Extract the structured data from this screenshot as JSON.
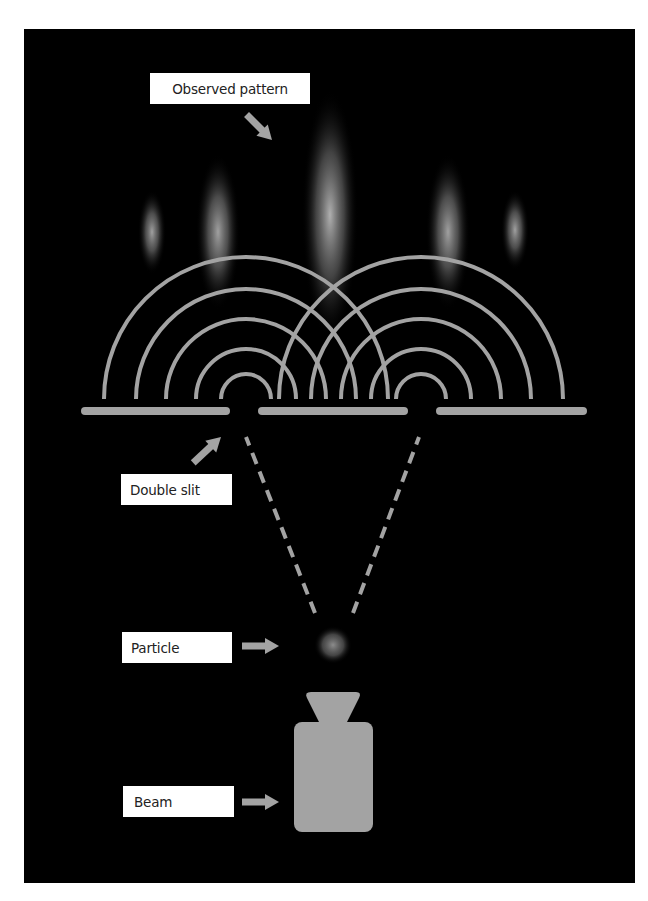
{
  "diagram": {
    "labels": {
      "observed_pattern": "Observed pattern",
      "double_slit": "Double slit",
      "particle": "Particle",
      "beam": "Beam"
    },
    "colors": {
      "background": "#000000",
      "page": "#ffffff",
      "element_gray": "#a3a3a3",
      "label_bg": "#ffffff",
      "label_text": "#222222"
    },
    "components": [
      {
        "name": "beam-emitter",
        "label": "Beam"
      },
      {
        "name": "particle",
        "label": "Particle"
      },
      {
        "name": "double-slit-barrier",
        "label": "Double slit",
        "slits": 2
      },
      {
        "name": "interference-waves",
        "arcs_per_slit": 5
      },
      {
        "name": "observed-pattern",
        "label": "Observed pattern",
        "bright_bands": 5
      }
    ]
  }
}
